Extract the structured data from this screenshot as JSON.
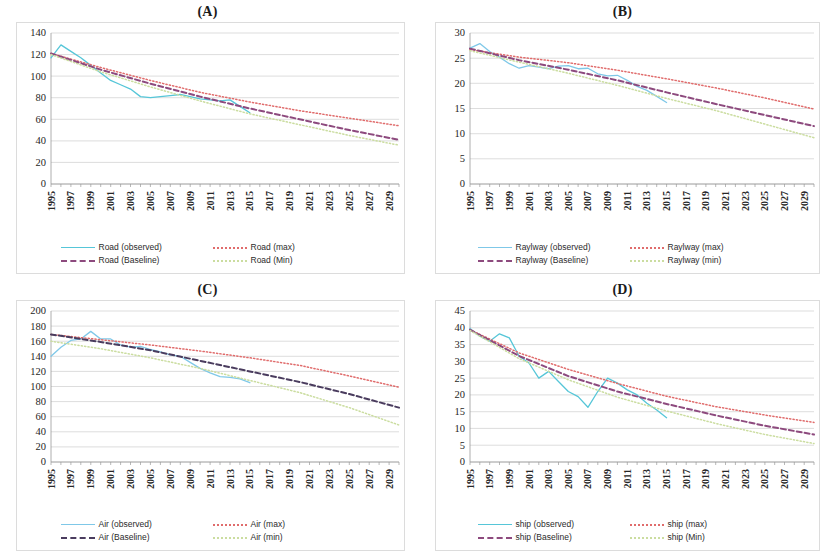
{
  "figure": {
    "panels": [
      {
        "id": "A",
        "title": "(A)",
        "mode": "Road",
        "legend": [
          {
            "label": "Road (observed)",
            "style": "solid",
            "color": "#56c6d8"
          },
          {
            "label": "Road (max)",
            "style": "dotted",
            "color": "#e06c6c"
          },
          {
            "label": "Road (Baseline)",
            "style": "dashed",
            "color": "#8d4a7e"
          },
          {
            "label": "Road (Min)",
            "style": "dotted",
            "color": "#cbdda0"
          }
        ],
        "chart_data": {
          "type": "line",
          "title": "(A)",
          "xlabel": "",
          "ylabel": "",
          "xlim": [
            1995,
            2030
          ],
          "ylim": [
            0,
            140
          ],
          "ytick_step": 20,
          "yticks": [
            0,
            20,
            40,
            60,
            80,
            100,
            120,
            140
          ],
          "xticks": [
            1995,
            1997,
            1999,
            2001,
            2003,
            2005,
            2007,
            2009,
            2011,
            2013,
            2015,
            2017,
            2019,
            2021,
            2023,
            2025,
            2027,
            2029
          ],
          "grid": true,
          "legend_position": "bottom",
          "series": [
            {
              "name": "Road (observed)",
              "style": "solid",
              "color": "#56c6d8",
              "x": [
                1995,
                1996,
                1997,
                1998,
                1999,
                2000,
                2001,
                2002,
                2003,
                2004,
                2005,
                2006,
                2007,
                2008,
                2009,
                2010,
                2011,
                2012,
                2013,
                2014,
                2015
              ],
              "values": [
                117,
                129,
                123,
                117,
                110,
                103,
                96,
                92,
                88,
                81,
                80,
                81,
                82,
                83,
                81,
                79,
                78,
                77,
                78,
                72,
                66
              ]
            },
            {
              "name": "Road (max)",
              "style": "dotted",
              "color": "#e06c6c",
              "x": [
                1995,
                2000,
                2005,
                2010,
                2015,
                2020,
                2025,
                2030
              ],
              "values": [
                121,
                108,
                96,
                85,
                76,
                68,
                61,
                54
              ]
            },
            {
              "name": "Road (Baseline)",
              "style": "dashed",
              "color": "#8d4a7e",
              "x": [
                1995,
                2000,
                2005,
                2010,
                2015,
                2020,
                2025,
                2030
              ],
              "values": [
                121,
                106,
                93,
                81,
                70,
                60,
                50,
                41
              ]
            },
            {
              "name": "Road (Min)",
              "style": "dotted",
              "color": "#cbdda0",
              "x": [
                1995,
                2000,
                2005,
                2010,
                2015,
                2020,
                2025,
                2030
              ],
              "values": [
                120,
                104,
                90,
                77,
                65,
                55,
                45,
                36
              ]
            }
          ]
        }
      },
      {
        "id": "B",
        "title": "(B)",
        "mode": "Raylway",
        "legend": [
          {
            "label": "Raylway (observed)",
            "style": "solid",
            "color": "#7fc8e8"
          },
          {
            "label": "Raylway (max)",
            "style": "dotted",
            "color": "#e06c6c"
          },
          {
            "label": "Raylway (Baseline)",
            "style": "dashed",
            "color": "#8d4a7e"
          },
          {
            "label": "Raylway (min)",
            "style": "dotted",
            "color": "#cbdda0"
          }
        ],
        "chart_data": {
          "type": "line",
          "title": "(B)",
          "xlabel": "",
          "ylabel": "",
          "xlim": [
            1995,
            2030
          ],
          "ylim": [
            0,
            30
          ],
          "ytick_step": 5,
          "yticks": [
            0,
            5,
            10,
            15,
            20,
            25,
            30
          ],
          "xticks": [
            1995,
            1997,
            1999,
            2001,
            2003,
            2005,
            2007,
            2009,
            2011,
            2013,
            2015,
            2017,
            2019,
            2021,
            2023,
            2025,
            2027,
            2029
          ],
          "grid": true,
          "legend_position": "bottom",
          "series": [
            {
              "name": "Raylway (observed)",
              "style": "solid",
              "color": "#7fc8e8",
              "x": [
                1995,
                1996,
                1997,
                1998,
                1999,
                2000,
                2001,
                2002,
                2003,
                2004,
                2005,
                2006,
                2007,
                2008,
                2009,
                2010,
                2011,
                2012,
                2013,
                2014,
                2015
              ],
              "values": [
                27.0,
                27.9,
                26.3,
                25.2,
                23.9,
                23.0,
                23.5,
                23.2,
                22.9,
                23.4,
                23.5,
                22.9,
                23.0,
                21.9,
                21.5,
                21.6,
                20.6,
                19.4,
                18.6,
                17.4,
                16.2
              ]
            },
            {
              "name": "Raylway (max)",
              "style": "dotted",
              "color": "#e06c6c",
              "x": [
                1995,
                2000,
                2005,
                2010,
                2015,
                2020,
                2025,
                2030
              ],
              "values": [
                26.7,
                25.2,
                24.1,
                22.6,
                20.9,
                19.1,
                17.1,
                14.9
              ]
            },
            {
              "name": "Raylway (Baseline)",
              "style": "dashed",
              "color": "#8d4a7e",
              "x": [
                1995,
                2000,
                2005,
                2010,
                2015,
                2020,
                2025,
                2030
              ],
              "values": [
                26.9,
                24.6,
                22.7,
                20.6,
                18.2,
                15.9,
                13.7,
                11.5
              ]
            },
            {
              "name": "Raylway (min)",
              "style": "dotted",
              "color": "#cbdda0",
              "x": [
                1995,
                2000,
                2005,
                2010,
                2015,
                2020,
                2025,
                2030
              ],
              "values": [
                26.5,
                24.2,
                22.0,
                19.6,
                17.0,
                14.6,
                11.9,
                9.2
              ]
            }
          ]
        }
      },
      {
        "id": "C",
        "title": "(C)",
        "mode": "Air",
        "legend": [
          {
            "label": "Air (observed)",
            "style": "solid",
            "color": "#7fc8e8"
          },
          {
            "label": "Air (max)",
            "style": "dotted",
            "color": "#e06c6c"
          },
          {
            "label": "Air (Baseline)",
            "style": "dashed",
            "color": "#4a3c5e"
          },
          {
            "label": "Air (min)",
            "style": "dotted",
            "color": "#cbdda0"
          }
        ],
        "chart_data": {
          "type": "line",
          "title": "(C)",
          "xlabel": "",
          "ylabel": "",
          "xlim": [
            1995,
            2030
          ],
          "ylim": [
            0,
            200
          ],
          "ytick_step": 20,
          "yticks": [
            0,
            20,
            40,
            60,
            80,
            100,
            120,
            140,
            160,
            180,
            200
          ],
          "xticks": [
            1995,
            1997,
            1999,
            2001,
            2003,
            2005,
            2007,
            2009,
            2011,
            2013,
            2015,
            2017,
            2019,
            2021,
            2023,
            2025,
            2027,
            2029
          ],
          "grid": true,
          "legend_position": "bottom",
          "series": [
            {
              "name": "Air (observed)",
              "style": "solid",
              "color": "#7fc8e8",
              "x": [
                1995,
                1996,
                1997,
                1998,
                1999,
                2000,
                2001,
                2002,
                2003,
                2004,
                2005,
                2006,
                2007,
                2008,
                2009,
                2010,
                2011,
                2012,
                2013,
                2014,
                2015
              ],
              "values": [
                140,
                152,
                161,
                163,
                173,
                163,
                163,
                155,
                152,
                153,
                149,
                146,
                142,
                140,
                132,
                124,
                118,
                113,
                112,
                110,
                105
              ]
            },
            {
              "name": "Air (max)",
              "style": "dotted",
              "color": "#e06c6c",
              "x": [
                1995,
                2000,
                2005,
                2010,
                2015,
                2020,
                2025,
                2030
              ],
              "values": [
                169,
                162,
                155,
                147,
                138,
                128,
                114,
                99
              ]
            },
            {
              "name": "Air (Baseline)",
              "style": "dashed",
              "color": "#4a3c5e",
              "x": [
                1995,
                2000,
                2005,
                2010,
                2015,
                2020,
                2025,
                2030
              ],
              "values": [
                169,
                159,
                148,
                134,
                120,
                106,
                90,
                72
              ]
            },
            {
              "name": "Air (min)",
              "style": "dotted",
              "color": "#cbdda0",
              "x": [
                1995,
                2000,
                2005,
                2010,
                2015,
                2020,
                2025,
                2030
              ],
              "values": [
                160,
                150,
                138,
                124,
                108,
                92,
                72,
                49
              ]
            }
          ]
        }
      },
      {
        "id": "D",
        "title": "(D)",
        "mode": "ship",
        "legend": [
          {
            "label": "ship (observed)",
            "style": "solid",
            "color": "#56c6d8"
          },
          {
            "label": "ship (max)",
            "style": "dotted",
            "color": "#e06c6c"
          },
          {
            "label": "ship (Baseline)",
            "style": "dashed",
            "color": "#8d4a7e"
          },
          {
            "label": "ship (Min)",
            "style": "dotted",
            "color": "#cbdda0"
          }
        ],
        "chart_data": {
          "type": "line",
          "title": "(D)",
          "xlabel": "",
          "ylabel": "",
          "xlim": [
            1995,
            2030
          ],
          "ylim": [
            0,
            45
          ],
          "ytick_step": 5,
          "yticks": [
            0,
            5,
            10,
            15,
            20,
            25,
            30,
            35,
            40,
            45
          ],
          "xticks": [
            1995,
            1997,
            1999,
            2001,
            2003,
            2005,
            2007,
            2009,
            2011,
            2013,
            2015,
            2017,
            2019,
            2021,
            2023,
            2025,
            2027,
            2029
          ],
          "grid": true,
          "legend_position": "bottom",
          "series": [
            {
              "name": "ship (observed)",
              "style": "solid",
              "color": "#56c6d8",
              "x": [
                1995,
                1996,
                1997,
                1998,
                1999,
                2000,
                2001,
                2002,
                2003,
                2004,
                2005,
                2006,
                2007,
                2008,
                2009,
                2010,
                2011,
                2012,
                2013,
                2014,
                2015
              ],
              "values": [
                39.8,
                37.5,
                36.0,
                38.2,
                37.0,
                31.5,
                29.5,
                25.0,
                27.0,
                24.0,
                21.0,
                19.5,
                16.3,
                21.0,
                25.0,
                23.5,
                21.5,
                20.0,
                17.5,
                15.5,
                13.2
              ]
            },
            {
              "name": "ship (max)",
              "style": "dotted",
              "color": "#e06c6c",
              "x": [
                1995,
                2000,
                2005,
                2010,
                2015,
                2020,
                2025,
                2030
              ],
              "values": [
                39.4,
                32.5,
                27.6,
                23.4,
                19.6,
                16.5,
                14.0,
                11.8
              ]
            },
            {
              "name": "ship (Baseline)",
              "style": "dashed",
              "color": "#8d4a7e",
              "x": [
                1995,
                2000,
                2005,
                2010,
                2015,
                2020,
                2025,
                2030
              ],
              "values": [
                39.4,
                31.6,
                25.6,
                21.0,
                17.3,
                13.9,
                10.8,
                8.2
              ]
            },
            {
              "name": "ship (Min)",
              "style": "dotted",
              "color": "#cbdda0",
              "x": [
                1995,
                2000,
                2005,
                2010,
                2015,
                2020,
                2025,
                2030
              ],
              "values": [
                39.2,
                30.8,
                24.5,
                19.3,
                15.2,
                11.5,
                8.2,
                5.5
              ]
            }
          ]
        }
      }
    ]
  }
}
